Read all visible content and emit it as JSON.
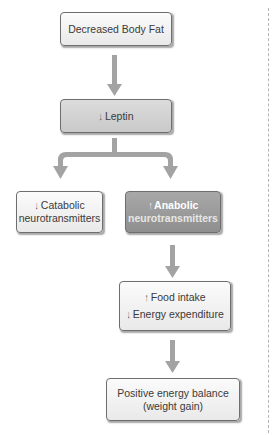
{
  "diagram": {
    "nodes": {
      "decreased_body_fat": {
        "label": "Decreased Body Fat"
      },
      "leptin": {
        "indicator": "↓",
        "label": "Leptin"
      },
      "catabolic": {
        "indicator": "↓",
        "line1": "Catabolic",
        "line2": "neurotransmitters"
      },
      "anabolic": {
        "indicator": "↑",
        "line1": "Anabolic",
        "line2": "neurotransmitters"
      },
      "food_intake": {
        "line1_indicator": "↑",
        "line1": "Food intake",
        "line2_indicator": "↓",
        "line2": "Energy expenditure"
      },
      "positive_balance": {
        "line1": "Positive energy balance",
        "line2": "(weight gain)"
      }
    },
    "edges": [
      {
        "from": "Decreased Body Fat",
        "to": "Leptin"
      },
      {
        "from": "Leptin",
        "to": "Catabolic neurotransmitters"
      },
      {
        "from": "Leptin",
        "to": "Anabolic neurotransmitters"
      },
      {
        "from": "Anabolic neurotransmitters",
        "to": "Food intake / Energy expenditure"
      },
      {
        "from": "Food intake / Energy expenditure",
        "to": "Positive energy balance (weight gain)"
      }
    ],
    "colors": {
      "arrow": "#a3a3a3",
      "box_border": "#6e6e6e",
      "highlight_box": "#9b9b9b",
      "divider": "#b5b5b5"
    }
  }
}
